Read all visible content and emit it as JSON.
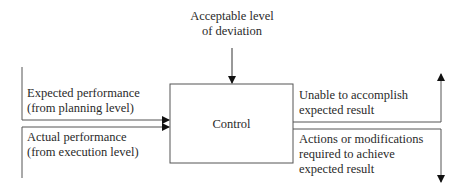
{
  "diagram": {
    "top_input": {
      "line1": "Acceptable level",
      "line2": "of deviation"
    },
    "process_box": {
      "label": "Control"
    },
    "left_inputs": [
      {
        "line1": "Expected performance",
        "line2": "(from planning level)"
      },
      {
        "line1": "Actual performance",
        "line2": "(from execution level)"
      }
    ],
    "right_outputs": [
      {
        "line1": "Unable to accomplish",
        "line2": "expected result",
        "direction": "up"
      },
      {
        "line1": "Actions or modifications",
        "line2": "required to achieve",
        "line3": "expected result",
        "direction": "down"
      }
    ],
    "colors": {
      "line": "#555555",
      "text": "#2a2a2a",
      "background": "#ffffff"
    }
  }
}
